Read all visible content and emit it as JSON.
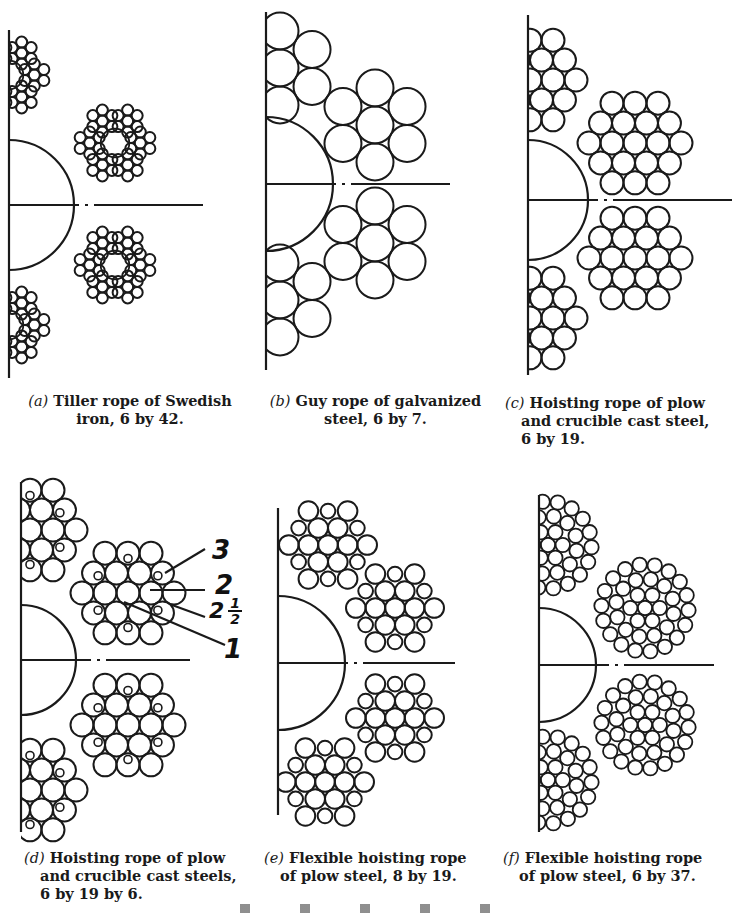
{
  "figure": {
    "panels": [
      {
        "id": "a",
        "label": "(a)",
        "caption_line1": "Tiller rope of Swedish",
        "caption_line2": "iron, 6 by 42.",
        "strands": 6,
        "wires_per_strand": 42,
        "material": "Swedish iron",
        "use": "Tiller rope"
      },
      {
        "id": "b",
        "label": "(b)",
        "caption_line1": "Guy rope of galvanized",
        "caption_line2": "steel, 6 by 7.",
        "strands": 6,
        "wires_per_strand": 7,
        "material": "galvanized steel",
        "use": "Guy rope"
      },
      {
        "id": "c",
        "label": "(c)",
        "caption_line1": "Hoisting rope of plow",
        "caption_line2": "and crucible cast steel,",
        "caption_line3": "6 by 19.",
        "strands": 6,
        "wires_per_strand": 19,
        "material": "plow and crucible cast steel",
        "use": "Hoisting rope"
      },
      {
        "id": "d",
        "label": "(d)",
        "caption_line1": "Hoisting rope of plow",
        "caption_line2": "and crucible cast steels,",
        "caption_line3": "6 by 19 by 6.",
        "strands": 6,
        "wires_per_strand": "19 by 6",
        "material": "plow and crucible cast steels",
        "use": "Hoisting rope",
        "annotations": [
          "3",
          "2",
          "2 1/2",
          "1"
        ]
      },
      {
        "id": "e",
        "label": "(e)",
        "caption_line1": "Flexible hoisting rope",
        "caption_line2": "of plow steel, 8 by 19.",
        "strands": 8,
        "wires_per_strand": 19,
        "material": "plow steel",
        "use": "Flexible hoisting rope"
      },
      {
        "id": "f",
        "label": "(f)",
        "caption_line1": "Flexible hoisting rope",
        "caption_line2": "of plow steel, 6 by 37.",
        "strands": 6,
        "wires_per_strand": 37,
        "material": "plow steel",
        "use": "Flexible hoisting rope"
      }
    ],
    "annotations_d": {
      "a3": "3",
      "a2": "2",
      "a25_whole": "2",
      "a25_num": "1",
      "a25_den": "2",
      "a1": "1"
    },
    "colors": {
      "ink": "#1a1a1a",
      "paper": "#ffffff"
    }
  }
}
